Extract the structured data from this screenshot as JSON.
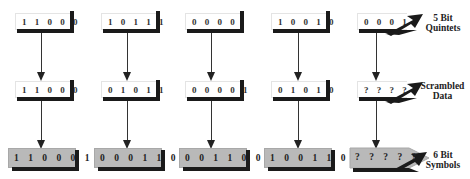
{
  "columns": [
    {
      "quintet": "11000",
      "scrambled": "11000",
      "symbol": "110001",
      "quintet_text": "1 1 0 0 0",
      "scrambled_text": "1 1 0 0 0",
      "symbol_text": "1 1 0 0 0 1"
    },
    {
      "quintet": "10111",
      "scrambled": "01011",
      "symbol": "000110",
      "quintet_text": "1 0 1 1 1",
      "scrambled_text": "0 1 0 1 1",
      "symbol_text": "0 0 0 1 1 0"
    },
    {
      "quintet": "0000",
      "scrambled": "00001",
      "symbol": "001100",
      "quintet_text": "0 0 0 0",
      "scrambled_text": "0 0 0 0 1",
      "symbol_text": "0 0 1 1 0 0"
    },
    {
      "quintet": "10010",
      "scrambled": "01010",
      "symbol": "100110",
      "quintet_text": "1 0 0 1 0",
      "scrambled_text": "0 1 0 1 0",
      "symbol_text": "1 0 0 1 1 0"
    },
    {
      "quintet": "0001",
      "scrambled": "????",
      "symbol": "?????",
      "quintet_text": "0 0 0 1",
      "scrambled_text": "? ? ? ?",
      "symbol_text": "? ? ? ? ?"
    }
  ],
  "labels": {
    "row1": [
      "5 Bit",
      "Quintets"
    ],
    "row2": [
      "Scrambled",
      "Data"
    ],
    "row3": [
      "6 Bit",
      "Symbols"
    ]
  },
  "colors": {
    "box_white": "#ffffff",
    "box_gray": "#b9b9b9",
    "shadow": "#1a1a1a",
    "arrow": "#333333"
  }
}
